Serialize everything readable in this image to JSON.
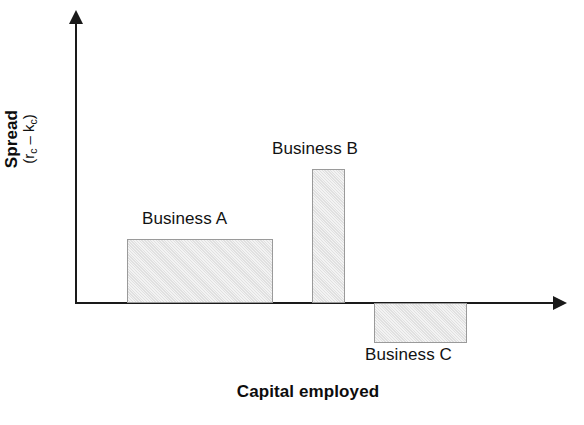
{
  "chart_data": {
    "type": "bar",
    "title": "",
    "subtitle": "",
    "xlabel": "Capital employed",
    "ylabel": "Spread (r_c – k_c)",
    "ylabel_main": "Spread",
    "ylabel_sub_open": "(r",
    "ylabel_sub_c1": "c",
    "ylabel_sub_minus": " – k",
    "ylabel_sub_c2": "c",
    "ylabel_sub_close": ")",
    "categories": [
      "Business A",
      "Business B",
      "Business C"
    ],
    "values": [
      1.0,
      2.1,
      -0.63
    ],
    "widths": [
      3.2,
      0.72,
      2.03
    ],
    "axis_origin_value": 0,
    "ylim": [
      -1.0,
      4.5
    ],
    "xlim": [
      0,
      10.6
    ],
    "grid": false,
    "legend": false,
    "legend_position": "none",
    "annotations": [
      {
        "text": "Business A",
        "attached_to": "Business A",
        "position": "above-bar"
      },
      {
        "text": "Business B",
        "attached_to": "Business B",
        "position": "above-bar"
      },
      {
        "text": "Business C",
        "attached_to": "Business C",
        "position": "below-bar"
      }
    ],
    "axis_style": "arrow-tipped open axes, no tick marks, no tick labels",
    "bars": [
      {
        "name": "Business A",
        "x_start": 1.15,
        "x_end": 4.35,
        "value": 1.0,
        "sign": "positive",
        "fill": "#e4e4e4",
        "border": "#9a9a9a"
      },
      {
        "name": "Business B",
        "x_start": 4.93,
        "x_end": 5.65,
        "value": 2.1,
        "sign": "positive",
        "fill": "#e4e4e4",
        "border": "#9a9a9a"
      },
      {
        "name": "Business C",
        "x_start": 6.22,
        "x_end": 8.25,
        "value": -0.63,
        "sign": "negative",
        "fill": "#e4e4e4",
        "border": "#9a9a9a"
      }
    ],
    "colors": {
      "bar_fill": "#e4e4e4",
      "bar_border": "#9a9a9a",
      "axis": "#1a1a1a",
      "text": "#121212",
      "background": "#ffffff"
    }
  },
  "labels": {
    "business_a": "Business A",
    "business_b": "Business B",
    "business_c": "Business C",
    "x_axis_title": "Capital employed",
    "y_axis_title_main": "Spread"
  },
  "icons": {
    "y_axis_arrow": "arrow-up-icon",
    "x_axis_arrow": "arrow-right-icon"
  }
}
